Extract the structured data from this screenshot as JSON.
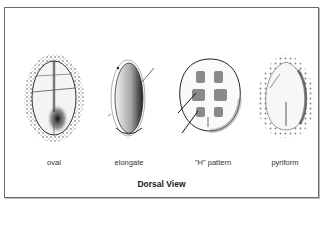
{
  "figure": {
    "title": "Dorsal View",
    "shapes": [
      {
        "id": "oval",
        "label": "oval"
      },
      {
        "id": "elongate",
        "label": "elongate"
      },
      {
        "id": "h-pattern",
        "label": "\"H\" pattern"
      },
      {
        "id": "pyriform",
        "label": "pyriform"
      }
    ]
  }
}
